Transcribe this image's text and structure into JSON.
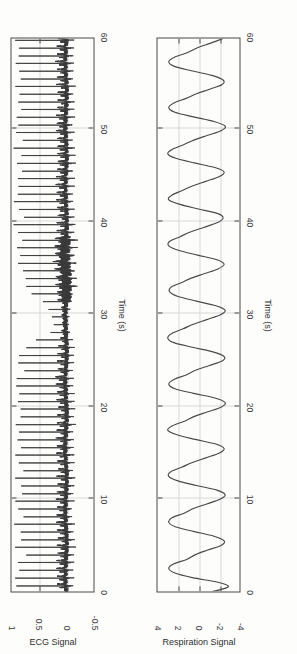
{
  "figure": {
    "rotation_deg": -90,
    "background_color": "#fdfdfc",
    "axis_color": "#4a4a4a",
    "grid_color": "#d8d8d8",
    "trace_color": "#3d3d3d",
    "panel_count": 2
  },
  "panels": {
    "ecg": {
      "ylabel": "ECG Signal",
      "xlabel": "Time (s)",
      "xticks": [
        "0",
        "10",
        "20",
        "30",
        "40",
        "50",
        "60"
      ],
      "yticks": [
        "-0.5",
        "0",
        "0.5",
        "1"
      ]
    },
    "respiration": {
      "ylabel": "Respiration Signal",
      "xlabel": "Time (s)",
      "xticks": [
        "0",
        "10",
        "20",
        "30",
        "40",
        "50",
        "60"
      ],
      "yticks": [
        "-4",
        "-2",
        "0",
        "2",
        "4"
      ]
    }
  },
  "chart_data": [
    {
      "type": "line",
      "id": "ecg",
      "title": "",
      "xlabel": "Time (s)",
      "ylabel": "ECG Signal",
      "xlim": [
        0,
        60
      ],
      "ylim": [
        -0.5,
        1
      ],
      "xticks": [
        0,
        10,
        20,
        30,
        40,
        50,
        60
      ],
      "yticks": [
        -0.5,
        0,
        0.5,
        1
      ],
      "grid": true,
      "legend": false,
      "description": "Single-lead ECG, ~60 s record, baseline near 0 with sharp R-peaks reaching about 0.6-1.0. Around t=32-38 s the amplitude collapses (motion/noise artefact) before recovering.",
      "series": [
        {
          "name": "ECG",
          "mean_rr_s": 0.83,
          "r_peak_times_s": [
            0.6,
            1.45,
            2.3,
            3.15,
            3.95,
            4.8,
            5.6,
            6.45,
            7.3,
            8.1,
            8.95,
            9.8,
            10.6,
            11.45,
            12.3,
            13.1,
            13.95,
            14.8,
            15.6,
            16.45,
            17.3,
            18.1,
            18.95,
            19.8,
            20.6,
            21.45,
            22.3,
            23.1,
            23.95,
            24.8,
            25.6,
            26.45,
            27.3,
            28.1,
            28.95,
            29.8,
            30.6,
            31.45,
            32.3,
            33.1,
            33.95,
            34.8,
            35.6,
            36.45,
            37.3,
            38.1,
            38.95,
            39.8,
            40.6,
            41.45,
            42.3,
            43.1,
            43.95,
            44.8,
            45.6,
            46.45,
            47.3,
            48.1,
            48.95,
            49.8,
            50.6,
            51.45,
            52.3,
            53.1,
            53.95,
            54.8,
            55.6,
            56.45,
            57.3,
            58.1,
            58.95,
            59.8
          ],
          "r_peak_amplitudes": [
            0.88,
            0.92,
            0.85,
            0.9,
            0.78,
            0.95,
            0.82,
            0.88,
            0.93,
            0.8,
            0.86,
            0.91,
            0.84,
            0.89,
            0.95,
            0.81,
            0.87,
            0.92,
            0.83,
            0.9,
            0.86,
            0.94,
            0.88,
            0.82,
            0.91,
            0.85,
            0.89,
            0.93,
            0.8,
            0.87,
            0.84,
            0.78,
            0.55,
            0.3,
            0.22,
            0.26,
            0.34,
            0.45,
            0.62,
            0.74,
            0.83,
            0.88,
            0.9,
            0.86,
            0.92,
            0.84,
            0.89,
            0.95,
            0.81,
            0.87,
            0.93,
            0.85,
            0.9,
            0.88,
            0.83,
            0.91,
            0.86,
            0.94,
            0.82,
            0.89,
            0.87,
            0.92,
            0.84,
            0.9,
            0.88,
            0.95,
            0.81,
            0.86,
            0.93,
            0.85,
            0.89,
            0.91
          ],
          "baseline": 0.0,
          "noise_amplitude": 0.07
        }
      ]
    },
    {
      "type": "line",
      "id": "respiration",
      "title": "",
      "xlabel": "Time (s)",
      "ylabel": "Respiration Signal",
      "xlim": [
        0,
        60
      ],
      "ylim": [
        -4,
        4
      ],
      "xticks": [
        0,
        10,
        20,
        30,
        40,
        50,
        60
      ],
      "yticks": [
        -4,
        -2,
        0,
        2,
        4
      ],
      "grid": true,
      "legend": false,
      "description": "Respiration belt signal, ~60 s, quasi-sinusoidal with breathing period around 4 s (roughly 15 breaths/min); peaks near +3 and troughs near -2.5, with a small shoulder on each descending limb.",
      "series": [
        {
          "name": "Respiration",
          "breath_period_s": 4.1,
          "peak_value": 3.0,
          "trough_value": -2.6,
          "samples_t": [
            0,
            0.5,
            1,
            1.5,
            2,
            2.5,
            3,
            3.5,
            4,
            4.5,
            5,
            5.5,
            6,
            6.5,
            7,
            7.5,
            8,
            8.5,
            9,
            9.5,
            10,
            10.5,
            11,
            11.5,
            12,
            12.5,
            13,
            13.5,
            14,
            14.5,
            15,
            15.5,
            16,
            16.5,
            17,
            17.5,
            18,
            18.5,
            19,
            19.5,
            20,
            20.5,
            21,
            21.5,
            22,
            22.5,
            23,
            23.5,
            24,
            24.5,
            25,
            25.5,
            26,
            26.5,
            27,
            27.5,
            28,
            28.5,
            29,
            29.5,
            30,
            30.5,
            31,
            31.5,
            32,
            32.5,
            33,
            33.5,
            34,
            34.5,
            35,
            35.5,
            36,
            36.5,
            37,
            37.5,
            38,
            38.5,
            39,
            39.5,
            40,
            40.5,
            41,
            41.5,
            42,
            42.5,
            43,
            43.5,
            44,
            44.5,
            45,
            45.5,
            46,
            46.5,
            47,
            47.5,
            48,
            48.5,
            49,
            49.5,
            50,
            50.5,
            51,
            51.5,
            52,
            52.5,
            53,
            53.5,
            54,
            54.5,
            55,
            55.5,
            56,
            56.5,
            57,
            57.5,
            58,
            58.5,
            59,
            59.5,
            60
          ],
          "samples_y": [
            -1.4,
            -2.9,
            -1.9,
            0.6,
            2.3,
            2.9,
            2.4,
            1.1,
            0.3,
            -0.9,
            -2.2,
            -2.5,
            -1.5,
            0.4,
            2.2,
            2.9,
            2.6,
            1.4,
            0.5,
            -0.8,
            -2.1,
            -2.6,
            -1.8,
            0.2,
            2.0,
            2.9,
            2.7,
            1.6,
            0.6,
            -0.7,
            -2.0,
            -2.5,
            -1.7,
            0.3,
            2.1,
            3.0,
            2.5,
            1.3,
            0.4,
            -0.9,
            -2.2,
            -2.6,
            -1.6,
            0.5,
            2.3,
            2.9,
            2.4,
            1.2,
            0.3,
            -1.0,
            -2.3,
            -2.5,
            -1.4,
            0.6,
            2.4,
            3.0,
            2.6,
            1.5,
            0.5,
            -0.8,
            -2.1,
            -2.6,
            -1.7,
            0.2,
            2.0,
            2.8,
            2.7,
            1.7,
            0.7,
            -0.6,
            -1.9,
            -2.5,
            -1.8,
            0.1,
            1.9,
            2.9,
            2.8,
            1.8,
            0.8,
            -0.5,
            -1.8,
            -2.4,
            -1.9,
            0.0,
            1.8,
            2.9,
            2.6,
            1.6,
            0.6,
            -0.7,
            -2.0,
            -2.5,
            -1.6,
            0.4,
            2.2,
            3.0,
            2.5,
            1.4,
            0.4,
            -0.9,
            -2.2,
            -2.6,
            -1.5,
            0.5,
            2.3,
            2.9,
            2.4,
            1.2,
            0.2,
            -1.1,
            -2.3,
            -2.4,
            -1.3,
            0.7,
            2.4,
            2.9,
            2.3,
            1.0,
            0.1,
            -1.2,
            -2.4
          ]
        }
      ]
    }
  ]
}
